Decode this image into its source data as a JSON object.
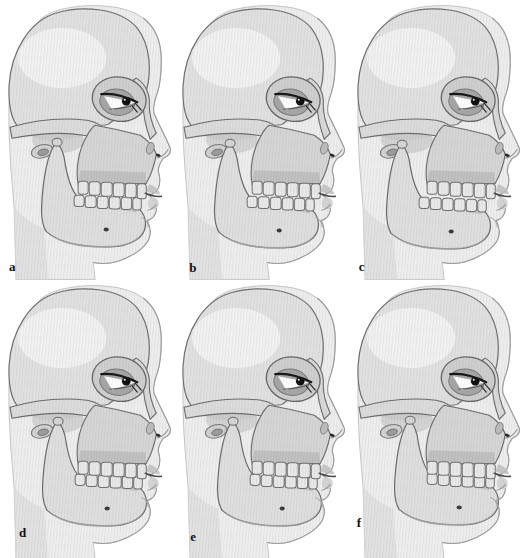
{
  "figure": {
    "type": "medical-illustration-plate",
    "grid": "2-rows-by-3-columns",
    "panels": [
      {
        "label": "a",
        "subject": "skull-profile-neutral-occlusion",
        "jaw_transform": "translate(0,0)"
      },
      {
        "label": "b",
        "subject": "skull-profile-slight-retrusion",
        "jaw_transform": "translate(-1,1)"
      },
      {
        "label": "c",
        "subject": "skull-profile-retruded-mandible",
        "jaw_transform": "translate(-4,2)"
      },
      {
        "label": "d",
        "subject": "skull-profile-prominent-chin",
        "jaw_transform": "translate(1,-1)"
      },
      {
        "label": "e",
        "subject": "skull-profile-edge-to-edge-bite",
        "jaw_transform": "translate(2,-1)"
      },
      {
        "label": "f",
        "subject": "skull-profile-protruded-mandible",
        "jaw_transform": "translate(4,-2)"
      }
    ],
    "colors": {
      "background": "#ffffff",
      "soft_tissue": "#eeeeee",
      "soft_tissue_line": "#c9c9c9",
      "bone_light": "#e1e1e1",
      "bone_mid": "#d6d6d6",
      "bone_shadow": "#a9a9a9",
      "outline": "#6b6b6b",
      "teeth": "#e9e9e9",
      "eye_ink": "#141414",
      "label_ink": "#111111"
    }
  }
}
